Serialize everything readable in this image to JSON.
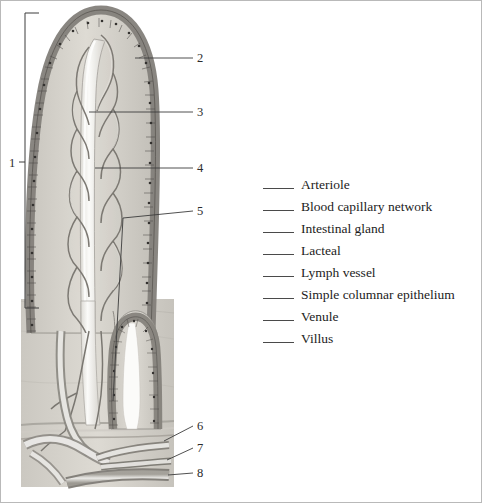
{
  "figure": {
    "title_present": false,
    "numbered_labels": [
      {
        "id": "1",
        "text": "1",
        "x": 8,
        "y": 156,
        "type": "bracket-label"
      },
      {
        "id": "2",
        "text": "2",
        "x": 196,
        "y": 51,
        "type": "leader-label"
      },
      {
        "id": "3",
        "text": "3",
        "x": 196,
        "y": 105,
        "type": "leader-label"
      },
      {
        "id": "4",
        "text": "4",
        "x": 196,
        "y": 161,
        "type": "leader-label"
      },
      {
        "id": "5",
        "text": "5",
        "x": 196,
        "y": 204,
        "type": "leader-label"
      },
      {
        "id": "6",
        "text": "6",
        "x": 196,
        "y": 419,
        "type": "leader-label"
      },
      {
        "id": "7",
        "text": "7",
        "x": 196,
        "y": 441,
        "type": "leader-label"
      },
      {
        "id": "8",
        "text": "8",
        "x": 196,
        "y": 466,
        "type": "leader-label"
      }
    ],
    "colors": {
      "tissue_light": "#d0cdc6",
      "tissue_mid": "#b9b6ae",
      "tissue_dark": "#8e8b84",
      "epithelium": "#8b8880",
      "nucleus": "#3a3a38",
      "lumen_white": "#f4f3f0",
      "vessel_outline": "#6f6d67",
      "leader_line": "#3c3c3c",
      "background": "#ffffff",
      "frame": "#b9b9b9"
    }
  },
  "word_list": {
    "blank_char": "_____",
    "items": [
      {
        "label": "Arteriole"
      },
      {
        "label": "Blood capillary network"
      },
      {
        "label": "Intestinal gland"
      },
      {
        "label": "Lacteal"
      },
      {
        "label": "Lymph vessel"
      },
      {
        "label": "Simple columnar epithelium"
      },
      {
        "label": "Venule"
      },
      {
        "label": "Villus"
      }
    ]
  }
}
